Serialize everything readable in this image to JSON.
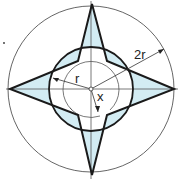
{
  "diagram": {
    "title": "",
    "labels": {
      "r": "r",
      "two_r": "2r",
      "x": "x"
    },
    "colors": {
      "stroke": "#1a1a1a",
      "thin_stroke": "#444444",
      "fill": "#d3ecf3",
      "background": "#ffffff"
    },
    "geometry": {
      "center": [
        91,
        89
      ],
      "outer_circle_radius": 83,
      "inner_circle_radius": 42,
      "angle_arc_radius": 28,
      "star_points": [
        [
          92,
          4
        ],
        [
          78,
          61
        ],
        [
          10,
          89
        ],
        [
          78,
          115
        ],
        [
          92,
          175
        ],
        [
          107,
          115
        ],
        [
          174,
          89
        ],
        [
          107,
          61
        ]
      ]
    }
  }
}
